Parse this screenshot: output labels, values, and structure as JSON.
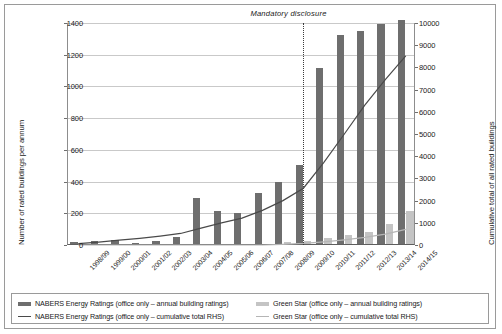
{
  "chart_data": {
    "type": "bar",
    "title": "",
    "subtitle": "",
    "xlabel": "",
    "ylabel": "Number of rated buildings per annum",
    "y2label": "Cumulative total of all rated buildings",
    "ylim": [
      0,
      1400
    ],
    "y2lim": [
      0,
      10000
    ],
    "yticks": [
      0,
      200,
      400,
      600,
      800,
      1000,
      1200,
      1400
    ],
    "y2ticks": [
      0,
      1000,
      2000,
      3000,
      4000,
      5000,
      6000,
      7000,
      8000,
      9000,
      10000
    ],
    "grid": true,
    "legend_position": "bottom",
    "categories": [
      "1998/99",
      "1999/00",
      "2000/01",
      "2001/02",
      "2002/03",
      "2003/04",
      "2004/05",
      "2005/06",
      "2006/07",
      "2007/08",
      "2008/09",
      "2009/10",
      "2010/11",
      "2011/12",
      "2012/13",
      "2013/14",
      "2014/15"
    ],
    "series": [
      {
        "name": "NABERS Energy Ratings (office only – annual building ratings)",
        "type": "bar",
        "axis": "left",
        "color": "#6e6e6e",
        "values": [
          10,
          22,
          28,
          8,
          22,
          42,
          288,
          208,
          196,
          322,
          392,
          498,
          1110,
          1315,
          1345,
          1390,
          1410
        ]
      },
      {
        "name": "Green Star (office only – annual building ratings)",
        "type": "bar",
        "axis": "left",
        "color": "#c4c4c4",
        "values": [
          0,
          0,
          0,
          0,
          0,
          0,
          0,
          0,
          0,
          0,
          10,
          22,
          40,
          58,
          75,
          128,
          210
        ]
      },
      {
        "name": "NABERS Energy Ratings (office only – cumulative total RHS)",
        "type": "line",
        "axis": "right",
        "color": "#4a4a4a",
        "values": [
          60,
          130,
          220,
          300,
          400,
          520,
          760,
          1000,
          1210,
          1560,
          2000,
          2560,
          3720,
          5000,
          6300,
          7450,
          8520
        ]
      },
      {
        "name": "Green Star (office only – cumulative total RHS)",
        "type": "line",
        "axis": "right",
        "color": "#b5b5b5",
        "values": [
          0,
          0,
          0,
          0,
          0,
          0,
          0,
          0,
          0,
          0,
          30,
          70,
          140,
          230,
          340,
          490,
          700
        ]
      }
    ],
    "annotations": [
      {
        "text": "Mandatory  disclosure",
        "at_category": "2009/10",
        "style": "vertical-dotted-line"
      }
    ]
  },
  "legend": {
    "items": [
      {
        "label": "NABERS Energy Ratings (office only – annual building ratings)",
        "marker": "bar",
        "color": "#6e6e6e"
      },
      {
        "label": "Green Star (office only – annual building ratings)",
        "marker": "bar",
        "color": "#c4c4c4"
      },
      {
        "label": "NABERS Energy Ratings (office only – cumulative total RHS)",
        "marker": "line",
        "color": "#4a4a4a"
      },
      {
        "label": "Green Star (office only – cumulative total RHS)",
        "marker": "line",
        "color": "#b5b5b5"
      }
    ]
  }
}
